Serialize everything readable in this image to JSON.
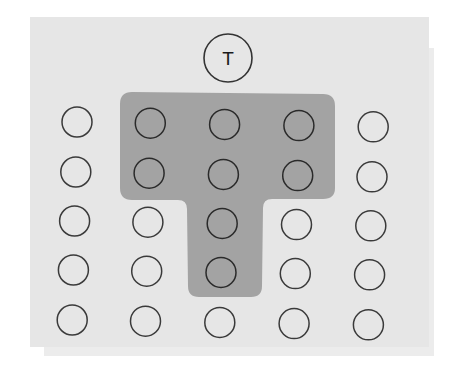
{
  "diagram": {
    "type": "seating-arrangement",
    "colors": {
      "panel": "#e6e6e6",
      "highlight": "#a3a3a3",
      "circle_stroke": "#333333"
    },
    "teacher": {
      "label": "T",
      "cx": 228,
      "cy": 58,
      "r": 24
    },
    "highlight_shape": "T-shape",
    "grid": {
      "columns": 5,
      "rows": 5,
      "column_x": [
        77,
        150,
        224,
        298,
        372
      ],
      "row_y": [
        122,
        172,
        221,
        270,
        320
      ],
      "seat_radius": 15
    },
    "highlighted_seats": [
      [
        0,
        1
      ],
      [
        0,
        2
      ],
      [
        0,
        3
      ],
      [
        1,
        1
      ],
      [
        1,
        2
      ],
      [
        1,
        3
      ],
      [
        2,
        2
      ],
      [
        3,
        2
      ]
    ]
  }
}
